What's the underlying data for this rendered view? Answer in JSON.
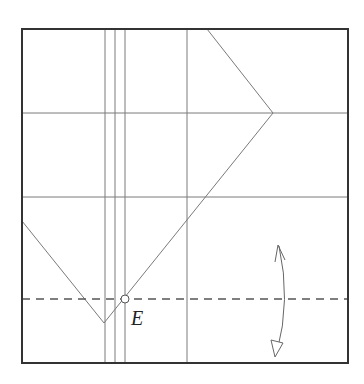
{
  "diagram": {
    "type": "origami-fold-diagram",
    "point_label": "E",
    "colors": {
      "border": "#333333",
      "crease": "#7a7a7a",
      "dashed": "#555555",
      "arrow": "#666666"
    },
    "square": {
      "x": 22,
      "y": 29,
      "size": 326
    },
    "creases": {
      "horizontal": [
        113,
        197
      ],
      "vertical": [
        105,
        115,
        125,
        187
      ]
    },
    "diagonals": [
      {
        "from": [
          207,
          29
        ],
        "to": [
          273,
          113
        ]
      },
      {
        "from": [
          273,
          113
        ],
        "to": [
          104,
          323
        ]
      },
      {
        "from": [
          22,
          221
        ],
        "to": [
          104,
          323
        ]
      }
    ],
    "valley_fold": {
      "y": 299,
      "style": "dashed"
    },
    "marker": {
      "x": 125,
      "y": 299,
      "r": 4
    },
    "fold_arrow": {
      "top": [
        279,
        244
      ],
      "bottom": [
        276,
        357
      ],
      "bulge_x": 286
    }
  }
}
